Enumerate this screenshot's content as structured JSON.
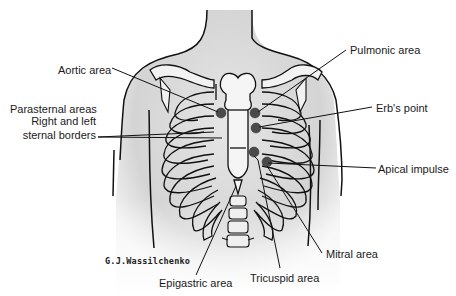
{
  "diagram": {
    "colors": {
      "line": "#111111",
      "skin_shade": "#d9d9d9",
      "bone_fill": "#eeeeee",
      "marker": "#4a4a4a"
    },
    "labels": {
      "aortic": "Aortic area",
      "pulmonic": "Pulmonic area",
      "parasternal_1": "Parasternal areas",
      "parasternal_2": "Right and left",
      "parasternal_3": "sternal borders",
      "erbs": "Erb's point",
      "apical": "Apical impulse",
      "mitral": "Mitral area",
      "tricuspid": "Tricuspid area",
      "epigastric": "Epigastric area"
    },
    "signature": "G.J.Wassilchenko",
    "markers": [
      {
        "name": "aortic-marker",
        "x": 221,
        "y": 113
      },
      {
        "name": "pulmonic-marker",
        "x": 255,
        "y": 113
      },
      {
        "name": "erbs-point-marker",
        "x": 256,
        "y": 127
      },
      {
        "name": "tricuspid-marker",
        "x": 254,
        "y": 152
      },
      {
        "name": "mitral-marker",
        "x": 266,
        "y": 162
      }
    ]
  }
}
